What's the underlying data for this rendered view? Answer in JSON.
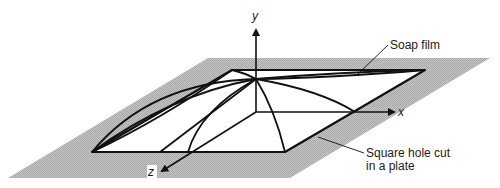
{
  "diagram": {
    "type": "3d-surface-illustration",
    "axes": {
      "x_label": "x",
      "y_label": "y",
      "z_label": "z"
    },
    "callouts": {
      "soap_film": "Soap film",
      "hole_line1": "Square hole cut",
      "hole_line2": "in a plate"
    },
    "colors": {
      "plate": "#bdbdbd",
      "lines": "#111111",
      "background": "#ffffff"
    }
  }
}
